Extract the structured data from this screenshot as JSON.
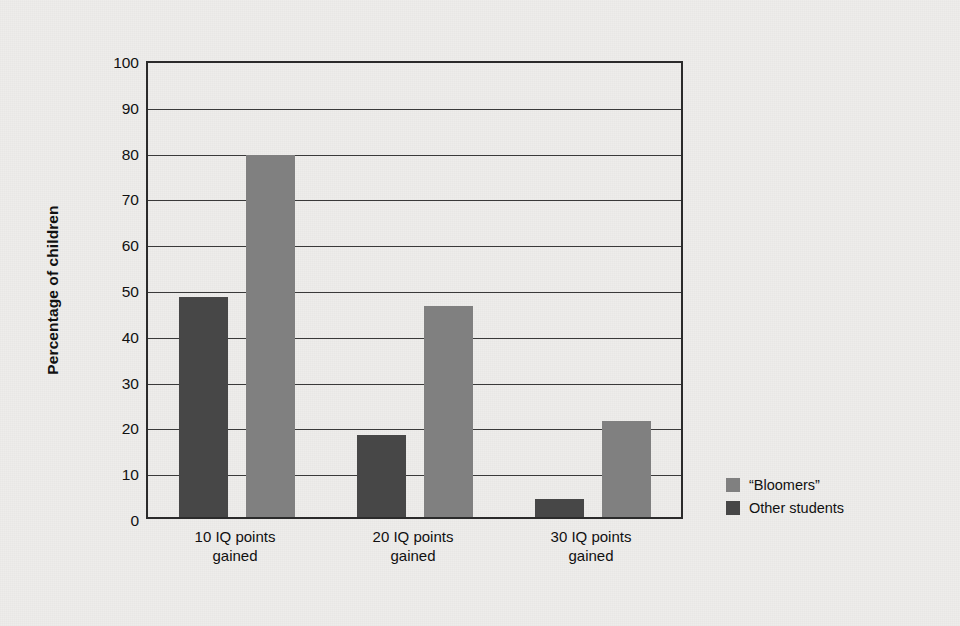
{
  "chart_data": {
    "type": "bar",
    "title": "",
    "xlabel": "",
    "ylabel": "Percentage of children",
    "categories": [
      "10 IQ points\ngained",
      "20 IQ points\ngained",
      "30 IQ points\ngained"
    ],
    "category_lines": [
      [
        "10 IQ points",
        "gained"
      ],
      [
        "20 IQ points",
        "gained"
      ],
      [
        "30 IQ points",
        "gained"
      ]
    ],
    "series": [
      {
        "name": "Other students",
        "color": "#474747",
        "values": [
          48,
          18,
          4
        ]
      },
      {
        "name": "“Bloomers”",
        "color": "#808080",
        "values": [
          79,
          46,
          21
        ]
      }
    ],
    "legend": {
      "position": "right",
      "entries": [
        {
          "label": "“Bloomers”",
          "color": "#808080"
        },
        {
          "label": "Other students",
          "color": "#474747"
        }
      ]
    },
    "ylim": [
      0,
      100
    ],
    "yticks": [
      0,
      10,
      20,
      30,
      40,
      50,
      60,
      70,
      80,
      90,
      100
    ],
    "ytick_labels": [
      "0",
      "10",
      "20",
      "30",
      "40",
      "50",
      "60",
      "70",
      "80",
      "90",
      "100"
    ],
    "grid": "horizontal",
    "background": "#eeedeb",
    "axis_color": "#2b2b2b"
  }
}
